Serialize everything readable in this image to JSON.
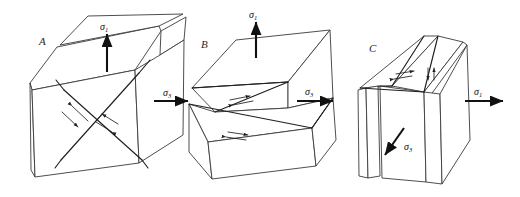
{
  "figure": {
    "background_color": "#ffffff",
    "line_color": "#3a3a3a",
    "fault_color": "#1f1f1f",
    "arrow_color": "#111111",
    "width": 520,
    "height": 197
  },
  "symbols": {
    "sigma": "σ",
    "sub_one": "1",
    "sub_three": "3"
  },
  "panels": [
    {
      "id": "A",
      "letter": "A",
      "description": "conjugate shear fractures forming an X in the block",
      "fracture_count": 2,
      "shear_couples": 2,
      "stresses": [
        {
          "name": "sigma-1-vertical",
          "symbol": "σ",
          "subscript": "1",
          "direction": "up",
          "orientation": "vertical"
        },
        {
          "name": "sigma-3-horizontal",
          "symbol": "σ",
          "subscript": "3",
          "direction": "right",
          "orientation": "horizontal"
        }
      ]
    },
    {
      "id": "B",
      "letter": "B",
      "description": "normal fault, hanging wall displaced down along a single inclined plane",
      "fracture_count": 1,
      "shear_couples": 2,
      "stresses": [
        {
          "name": "sigma-1-vertical",
          "symbol": "σ",
          "subscript": "1",
          "direction": "up",
          "orientation": "vertical"
        },
        {
          "name": "sigma-3-horizontal",
          "symbol": "σ",
          "subscript": "3",
          "direction": "right",
          "orientation": "horizontal"
        }
      ]
    },
    {
      "id": "C",
      "letter": "C",
      "description": "reverse or thrust fault, block shortened along an inclined plane",
      "fracture_count": 1,
      "shear_couples": 2,
      "stresses": [
        {
          "name": "sigma-1-horizontal",
          "symbol": "σ",
          "subscript": "1",
          "direction": "right",
          "orientation": "horizontal"
        },
        {
          "name": "sigma-3-diagonal",
          "symbol": "σ",
          "subscript": "3",
          "direction": "down-left",
          "orientation": "diagonal"
        }
      ]
    }
  ]
}
